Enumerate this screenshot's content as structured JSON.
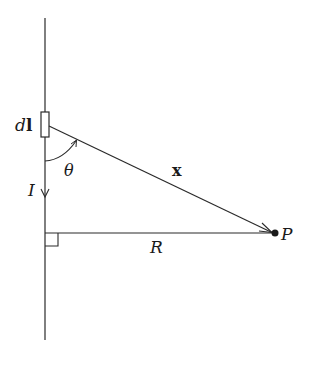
{
  "diagram": {
    "colors": {
      "stroke": "#2a2a2a",
      "background": "#ffffff"
    },
    "labels": {
      "current_element": "dl",
      "current_element_d": "d",
      "current_element_l": "l",
      "current": "I",
      "angle": "θ",
      "displacement": "x",
      "distance": "R",
      "point": "P"
    },
    "elements": {
      "wire": {
        "x": 45,
        "y1": 18,
        "y2": 340
      },
      "current_element_box": {
        "x": 41,
        "y": 112,
        "w": 8,
        "h": 25
      },
      "vector_x": {
        "x1": 49,
        "y1": 125,
        "x2": 273,
        "y2": 233
      },
      "perpendicular_R": {
        "x1": 45,
        "y1": 233,
        "x2": 273,
        "y2": 233
      },
      "right_angle_marker": {
        "x": 45,
        "y": 233,
        "size": 13
      },
      "point_P": {
        "cx": 275,
        "cy": 233,
        "r": 3.5
      }
    }
  }
}
